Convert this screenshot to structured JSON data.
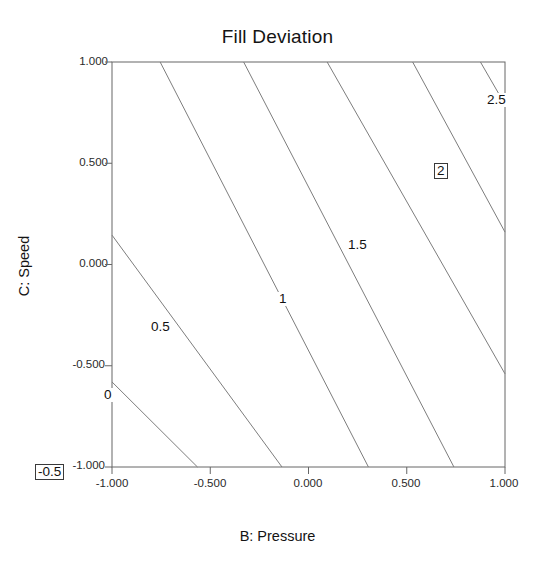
{
  "chart_data": {
    "type": "contour",
    "title": "Fill Deviation",
    "xlabel": "B: Pressure",
    "ylabel": "C: Speed",
    "xlim": [
      -1.0,
      1.0
    ],
    "ylim": [
      -1.0,
      1.0
    ],
    "grid": false,
    "legend": "none",
    "xticks": [
      "-1.000",
      "-0.500",
      "0.000",
      "0.500",
      "1.000"
    ],
    "xtick_values": [
      -1.0,
      -0.5,
      0.0,
      0.5,
      1.0
    ],
    "yticks": [
      "1.000",
      "0.500",
      "0.000",
      "-0.500",
      "-1.000"
    ],
    "ytick_values": [
      1.0,
      0.5,
      0.0,
      -0.5,
      -1.0
    ],
    "contour_levels": [
      -0.5,
      0,
      0.5,
      1,
      1.5,
      2,
      2.5
    ],
    "contour_level_labels": [
      "-0.5",
      "0",
      "0.5",
      "1",
      "1.5",
      "2",
      "2.5"
    ],
    "contours": [
      {
        "level": -0.5,
        "label": "-0.5",
        "boxed": true,
        "label_x": 0.09,
        "label_y": 0.83,
        "endpoints": [
          [
            -1.0,
            -0.58
          ],
          [
            -0.565,
            -1.0
          ]
        ]
      },
      {
        "level": 0,
        "label": "0",
        "boxed": false,
        "label_x": 0.195,
        "label_y": 0.695,
        "endpoints": [
          [
            -1.0,
            0.145
          ],
          [
            -0.135,
            -1.0
          ]
        ]
      },
      {
        "level": 0.5,
        "label": "0.5",
        "boxed": false,
        "label_x": 0.29,
        "label_y": 0.575,
        "endpoints": [
          [
            -0.755,
            1.0
          ],
          [
            0.305,
            -1.0
          ]
        ]
      },
      {
        "level": 1,
        "label": "1",
        "boxed": false,
        "label_x": 0.51,
        "label_y": 0.525,
        "endpoints": [
          [
            -0.33,
            1.0
          ],
          [
            0.74,
            -1.0
          ]
        ]
      },
      {
        "level": 1.5,
        "label": "1.5",
        "boxed": false,
        "label_x": 0.645,
        "label_y": 0.43,
        "endpoints": [
          [
            0.095,
            1.0
          ],
          [
            1.0,
            -0.54
          ]
        ]
      },
      {
        "level": 2,
        "label": "2",
        "boxed": true,
        "label_x": 0.795,
        "label_y": 0.3,
        "endpoints": [
          [
            0.53,
            1.0
          ],
          [
            1.0,
            0.16
          ]
        ]
      },
      {
        "level": 2.5,
        "label": "2.5",
        "boxed": false,
        "label_x": 0.895,
        "label_y": 0.175,
        "endpoints": [
          [
            0.875,
            1.0
          ],
          [
            1.0,
            0.79
          ]
        ]
      }
    ]
  },
  "colors": {
    "axis": "#555555",
    "contour_line": "#7d7d7d",
    "text": "#141414",
    "background": "#ffffff"
  }
}
